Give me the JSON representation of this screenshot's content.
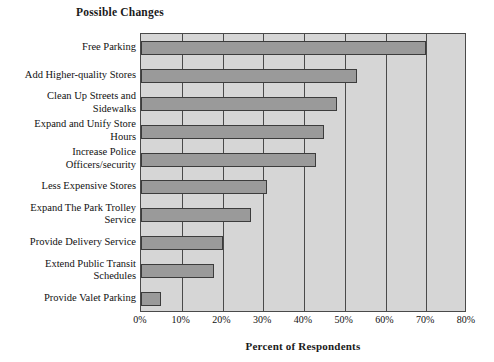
{
  "chart_data": {
    "type": "bar",
    "orientation": "horizontal",
    "title": "Possible Changes",
    "xlabel": "Percent of Respondents",
    "ylabel": "",
    "xlim": [
      0,
      80
    ],
    "grid": true,
    "legend": "none",
    "xtick_labels": [
      "0%",
      "10%",
      "20%",
      "30%",
      "40%",
      "50%",
      "60%",
      "70%",
      "80%"
    ],
    "xtick_values": [
      0,
      10,
      20,
      30,
      40,
      50,
      60,
      70,
      80
    ],
    "categories": [
      "Free Parking",
      "Add Higher-quality Stores",
      "Clean Up Streets and Sidewalks",
      "Expand and Unify Store Hours",
      "Increase Police Officers/security",
      "Less Expensive Stores",
      "Expand The Park Trolley Service",
      "Provide Delivery Service",
      "Extend Public Transit Schedules",
      "Provide Valet Parking"
    ],
    "category_label_lines": [
      [
        "Free Parking"
      ],
      [
        "Add Higher-quality Stores"
      ],
      [
        "Clean Up Streets and",
        "Sidewalks"
      ],
      [
        "Expand and Unify Store",
        "Hours"
      ],
      [
        "Increase Police",
        "Officers/security"
      ],
      [
        "Less Expensive Stores"
      ],
      [
        "Expand The Park Trolley",
        "Service"
      ],
      [
        "Provide Delivery Service"
      ],
      [
        "Extend Public Transit",
        "Schedules"
      ],
      [
        "Provide Valet Parking"
      ]
    ],
    "values": [
      70,
      53,
      48,
      45,
      43,
      31,
      27,
      20,
      18,
      5
    ],
    "colors": {
      "bar_fill": "#9a9a9a",
      "bar_border": "#3c3c3c",
      "plot_background": "#d6d6d6",
      "plot_border": "#4a4a4a",
      "gridline": "#4a4a4a",
      "text": "#111111",
      "page_background": "#ffffff"
    }
  }
}
